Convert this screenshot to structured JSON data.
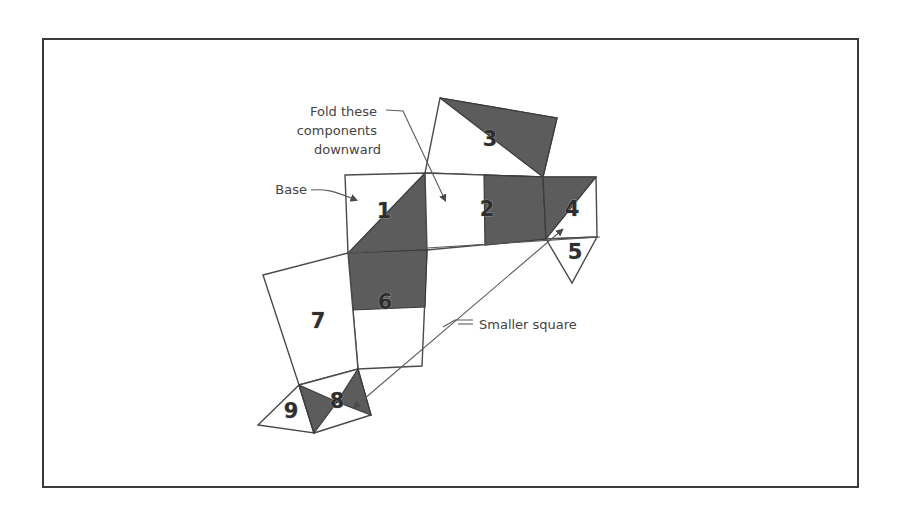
{
  "diagram": {
    "labels": {
      "fold_line1": "Fold these",
      "fold_line2": "components",
      "fold_line3": "downward",
      "base": "Base",
      "smaller_square": "Smaller square"
    },
    "pieces": [
      {
        "id": "1",
        "label": "1"
      },
      {
        "id": "2",
        "label": "2"
      },
      {
        "id": "3",
        "label": "3"
      },
      {
        "id": "4",
        "label": "4"
      },
      {
        "id": "5",
        "label": "5"
      },
      {
        "id": "6",
        "label": "6"
      },
      {
        "id": "7",
        "label": "7"
      },
      {
        "id": "8",
        "label": "8"
      },
      {
        "id": "9",
        "label": "9"
      }
    ],
    "colors": {
      "shade": "#5c5c5c",
      "line": "#4a4a4a",
      "frame": "#3a3a3a",
      "text": "#444444"
    }
  }
}
